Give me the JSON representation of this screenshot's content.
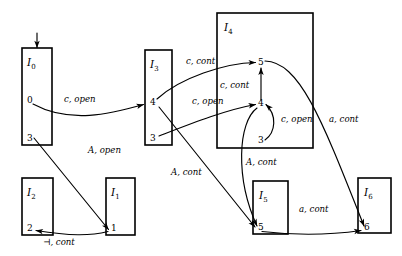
{
  "diagram": {
    "kind": "automaton-item-set-transition-diagram",
    "background_color": "#ffffff",
    "stroke_color": "#000000",
    "start_marker": {
      "name": "start-arrow",
      "target_box": "I0",
      "direction": "down"
    },
    "boxes": [
      {
        "id": "I0",
        "title_base": "I",
        "title_sub": "0",
        "x": 22,
        "y": 48,
        "width": 30,
        "height": 97,
        "items": [
          {
            "label": "0",
            "x": 27,
            "y": 103
          },
          {
            "label": "3",
            "x": 27,
            "y": 141
          }
        ]
      },
      {
        "id": "I1",
        "title_base": "I",
        "title_sub": "1",
        "x": 106,
        "y": 178,
        "width": 29,
        "height": 57,
        "items": [
          {
            "label": "1",
            "x": 111,
            "y": 231
          }
        ]
      },
      {
        "id": "I2",
        "title_base": "I",
        "title_sub": "2",
        "x": 22,
        "y": 178,
        "width": 31,
        "height": 57,
        "items": [
          {
            "label": "2",
            "x": 27,
            "y": 231
          }
        ]
      },
      {
        "id": "I3",
        "title_base": "I",
        "title_sub": "3",
        "x": 145,
        "y": 50,
        "width": 27,
        "height": 95,
        "items": [
          {
            "label": "4",
            "x": 150,
            "y": 105
          },
          {
            "label": "3",
            "x": 150,
            "y": 141
          }
        ]
      },
      {
        "id": "I4",
        "title_base": "I",
        "title_sub": "4",
        "x": 217,
        "y": 13,
        "width": 96,
        "height": 135,
        "items": [
          {
            "label": "5",
            "x": 258,
            "y": 65
          },
          {
            "label": "4",
            "x": 258,
            "y": 106
          },
          {
            "label": "3",
            "x": 258,
            "y": 143
          }
        ]
      },
      {
        "id": "I5",
        "title_base": "I",
        "title_sub": "5",
        "x": 253,
        "y": 181,
        "width": 35,
        "height": 53,
        "items": [
          {
            "label": "5",
            "x": 258,
            "y": 230
          }
        ]
      },
      {
        "id": "I6",
        "title_base": "I",
        "title_sub": "6",
        "x": 358,
        "y": 178,
        "width": 33,
        "height": 55,
        "items": [
          {
            "label": "6",
            "x": 364,
            "y": 230
          }
        ]
      }
    ],
    "edge_labels": [
      {
        "id": "lbl-c-open-1",
        "text": "c, open",
        "x": 64,
        "y": 102
      },
      {
        "id": "lbl-A-open",
        "text": "A, open",
        "x": 88,
        "y": 153
      },
      {
        "id": "lbl-turnstile-cont",
        "text": "⊣, cont",
        "x": 43,
        "y": 245
      },
      {
        "id": "lbl-c-cont-1",
        "text": "c, cont",
        "x": 186,
        "y": 64
      },
      {
        "id": "lbl-c-cont-2",
        "text": "c, cont",
        "x": 220,
        "y": 88
      },
      {
        "id": "lbl-c-open-2",
        "text": "c, open",
        "x": 192,
        "y": 104
      },
      {
        "id": "lbl-A-cont-1",
        "text": "A, cont",
        "x": 171,
        "y": 175
      },
      {
        "id": "lbl-A-cont-2",
        "text": "A, cont",
        "x": 246,
        "y": 165
      },
      {
        "id": "lbl-c-open-3",
        "text": "c, open",
        "x": 281,
        "y": 122
      },
      {
        "id": "lbl-a-cont-1",
        "text": "a, cont",
        "x": 329,
        "y": 122
      },
      {
        "id": "lbl-a-cont-2",
        "text": "a, cont",
        "x": 299,
        "y": 212
      }
    ],
    "edges": [
      {
        "id": "edge-I0-0-to-I3-4",
        "from": "I0.0",
        "to": "I3.4",
        "symbol": "c, open"
      },
      {
        "id": "edge-I0-3-to-I1-1",
        "from": "I0.3",
        "to": "I1.1",
        "symbol": "A, open"
      },
      {
        "id": "edge-I1-1-to-I2-2",
        "from": "I1.1",
        "to": "I2.2",
        "symbol": "⊣, cont"
      },
      {
        "id": "edge-I3-4-to-I4-5",
        "from": "I3.4",
        "to": "I4.5",
        "symbol": "c, cont"
      },
      {
        "id": "edge-I3-3-to-I4-4",
        "from": "I3.3",
        "to": "I4.4",
        "symbol": "c, open"
      },
      {
        "id": "edge-I3-4-to-I5-5",
        "from": "I3.4",
        "to": "I5.5",
        "symbol": "A, cont"
      },
      {
        "id": "edge-I4-4-to-I4-5",
        "from": "I4.4",
        "to": "I4.5",
        "symbol": "c, cont"
      },
      {
        "id": "edge-I4-3-to-I4-4",
        "from": "I4.3",
        "to": "I4.4",
        "symbol": "c, open"
      },
      {
        "id": "edge-I4-4-to-I5-5",
        "from": "I4.4",
        "to": "I5.5",
        "symbol": "A, cont"
      },
      {
        "id": "edge-I4-5-to-I6-6",
        "from": "I4.5",
        "to": "I6.6",
        "symbol": "a, cont"
      },
      {
        "id": "edge-I5-5-to-I6-6",
        "from": "I5.5",
        "to": "I6.6",
        "symbol": "a, cont"
      }
    ]
  }
}
